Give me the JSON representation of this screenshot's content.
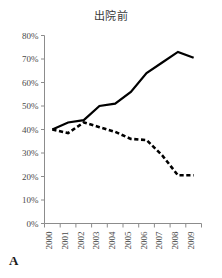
{
  "panel": {
    "label": "A"
  },
  "chart_data": {
    "type": "line",
    "title": "出院前",
    "xlabel": "",
    "ylabel": "",
    "xlim": [
      2000,
      2009
    ],
    "ylim": [
      0,
      80
    ],
    "grid": false,
    "legend_position": "none",
    "categories": [
      "2000",
      "2001",
      "2002",
      "2003",
      "2004",
      "2005",
      "2006",
      "2007",
      "2008",
      "2009"
    ],
    "x": [
      2000,
      2001,
      2002,
      2003,
      2004,
      2005,
      2006,
      2007,
      2008,
      2009
    ],
    "y_tick_labels": [
      "0%",
      "10%",
      "20%",
      "30%",
      "40%",
      "50%",
      "60%",
      "70%",
      "80%"
    ],
    "y_tick_values": [
      0,
      10,
      20,
      30,
      40,
      50,
      60,
      70,
      80
    ],
    "series": [
      {
        "name": "solid-series",
        "style": "solid",
        "color": "#000000",
        "values": [
          40,
          43,
          44,
          50,
          51,
          56,
          64,
          68.5,
          73,
          70.5
        ]
      },
      {
        "name": "dashed-series",
        "style": "dashed",
        "color": "#000000",
        "values": [
          40,
          38.5,
          43,
          41,
          39,
          36,
          35.5,
          29,
          20.5,
          20.5
        ]
      }
    ]
  }
}
